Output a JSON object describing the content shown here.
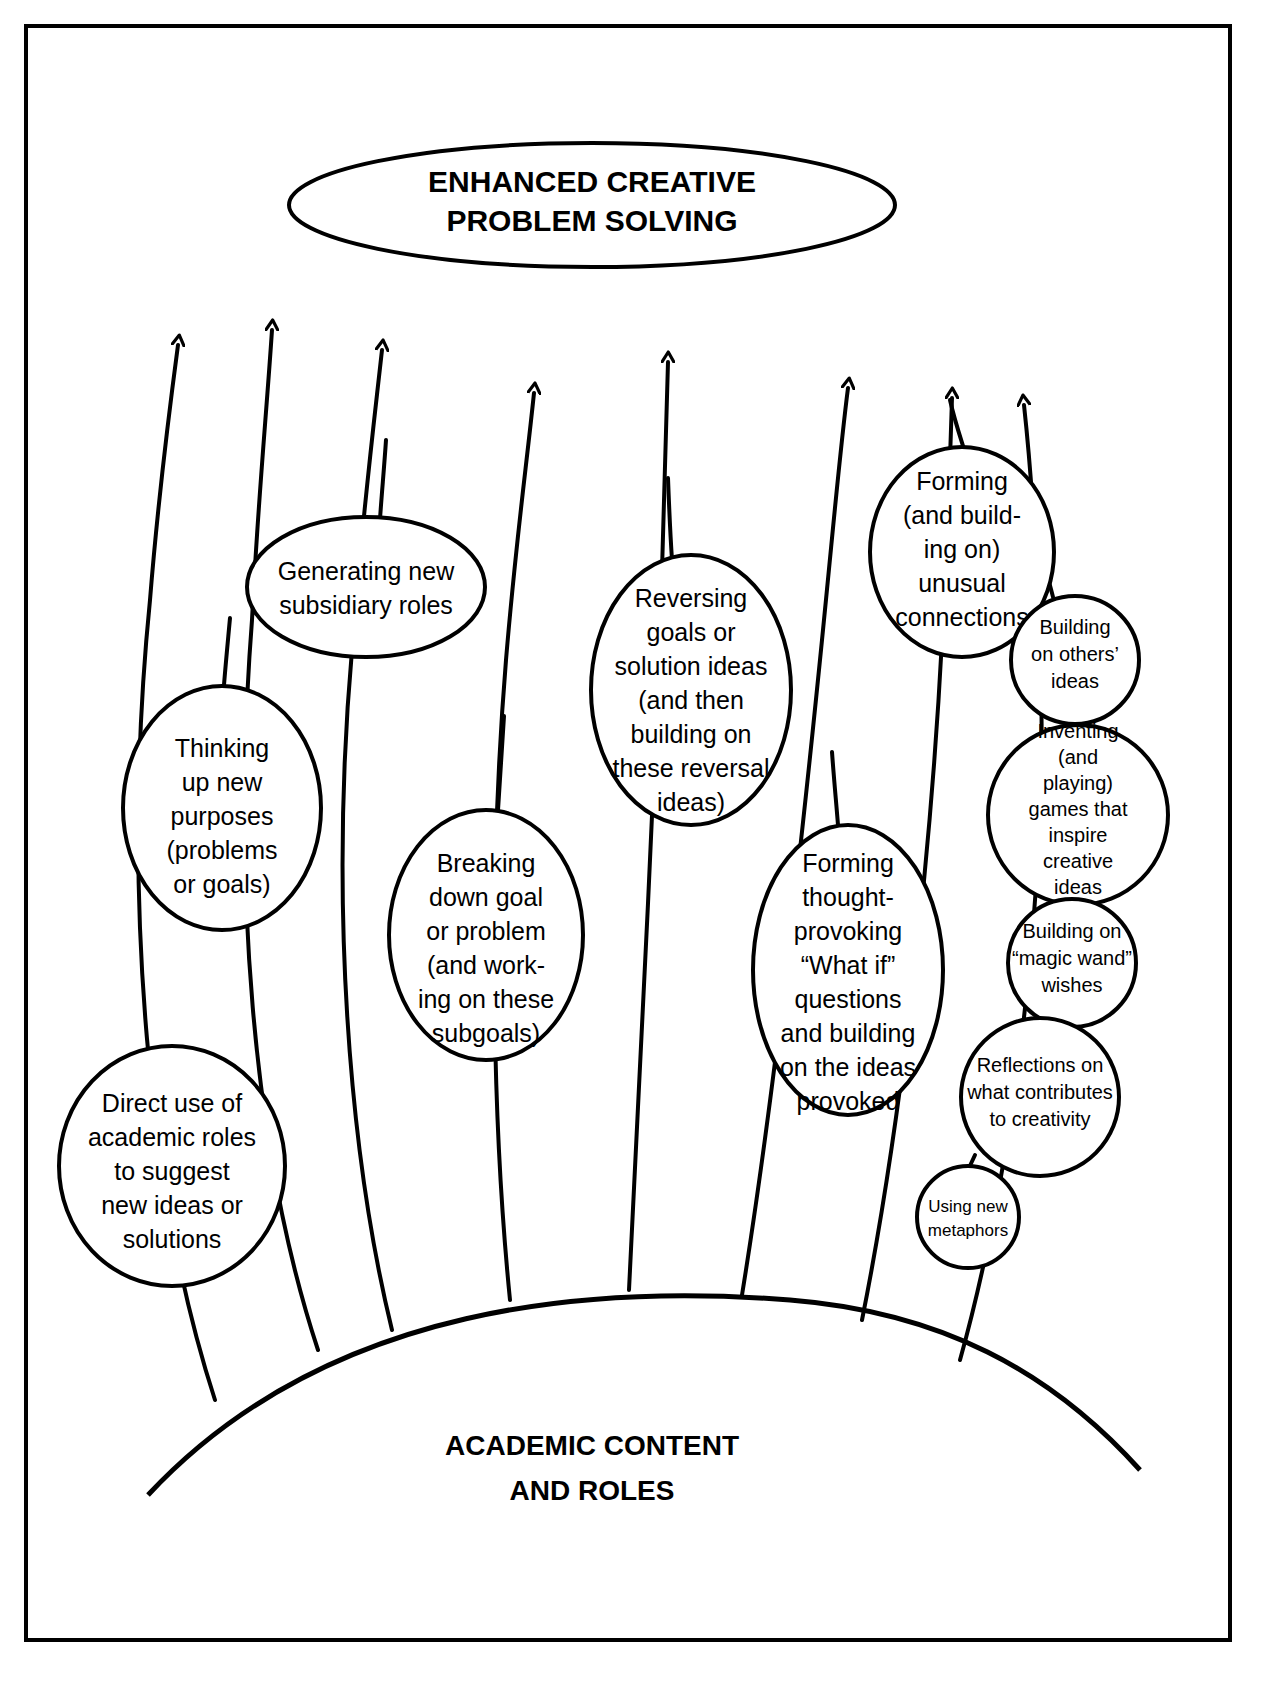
{
  "diagram": {
    "type": "concept-map",
    "title_node": {
      "id": "enhanced-creative-problem-solving",
      "lines": [
        "ENHANCED CREATIVE",
        "PROBLEM SOLVING"
      ],
      "shape": "ellipse"
    },
    "base_node": {
      "id": "academic-content-and-roles",
      "lines": [
        "ACADEMIC CONTENT",
        "AND ROLES"
      ],
      "shape": "arc"
    },
    "nodes": [
      {
        "id": "direct-use-of-academic-roles",
        "lines": [
          "Direct use of",
          "academic roles",
          "to suggest",
          "new ideas or",
          "solutions"
        ],
        "shape": "ellipse",
        "size": "regular"
      },
      {
        "id": "thinking-up-new-purposes",
        "lines": [
          "Thinking",
          "up new",
          "purposes",
          "(problems",
          "or goals)"
        ],
        "shape": "ellipse",
        "size": "regular"
      },
      {
        "id": "generating-new-subsidiary-roles",
        "lines": [
          "Generating new",
          "subsidiary roles"
        ],
        "shape": "ellipse",
        "size": "regular"
      },
      {
        "id": "breaking-down-goal-or-problem",
        "lines": [
          "Breaking",
          "down goal",
          "or problem",
          "(and work-",
          "ing on these",
          "subgoals)"
        ],
        "shape": "ellipse",
        "size": "regular"
      },
      {
        "id": "reversing-goals-or-solution-ideas",
        "lines": [
          "Reversing",
          "goals or",
          "solution ideas",
          "(and then",
          "building on",
          "these reversal",
          "ideas)"
        ],
        "shape": "ellipse",
        "size": "regular"
      },
      {
        "id": "forming-thought-provoking-what-if-questions",
        "lines": [
          "Forming",
          "thought-",
          "provoking",
          "“What if”",
          "questions",
          "and building",
          "on the ideas",
          "provoked"
        ],
        "shape": "ellipse",
        "size": "regular"
      },
      {
        "id": "forming-unusual-connections",
        "lines": [
          "Forming",
          "(and build-",
          "ing on)",
          "unusual",
          "connections"
        ],
        "shape": "ellipse",
        "size": "regular"
      },
      {
        "id": "building-on-others-ideas",
        "lines": [
          "Building",
          "on others’",
          "ideas"
        ],
        "shape": "circle",
        "size": "small"
      },
      {
        "id": "inventing-games-that-inspire-creative-ideas",
        "lines": [
          "Inventing",
          "(and",
          "playing)",
          "games that",
          "inspire",
          "creative",
          "ideas"
        ],
        "shape": "circle",
        "size": "small"
      },
      {
        "id": "building-on-magic-wand-wishes",
        "lines": [
          "Building on",
          "“magic wand”",
          "wishes"
        ],
        "shape": "circle",
        "size": "small"
      },
      {
        "id": "reflections-on-what-contributes-to-creativity",
        "lines": [
          "Reflections on",
          "what contributes",
          "to creativity"
        ],
        "shape": "circle",
        "size": "small"
      },
      {
        "id": "using-new-metaphors",
        "lines": [
          "Using new",
          "metaphors"
        ],
        "shape": "circle",
        "size": "tiny"
      }
    ],
    "colors": {
      "stroke": "#000000",
      "fill": "#ffffff",
      "text": "#000000"
    },
    "arrow_count": 8
  }
}
